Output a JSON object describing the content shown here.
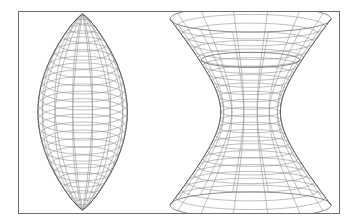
{
  "figure": {
    "background_color": "#ffffff",
    "border_color": "#6e6e6e",
    "line_color": "#8c8c8c",
    "outline_color": "#5f5f5f",
    "panel": {
      "x": 18,
      "y": 11,
      "width": 322,
      "height": 203
    },
    "shapes": [
      {
        "id": "lemon",
        "label": "lemon surface",
        "type": "spindle",
        "description": "Prolate lemon / football surface of revolution with cusp points at top and bottom",
        "center_x": 82,
        "top_y": 13,
        "bottom_y": 211,
        "max_half_width": 45,
        "meridians": 14,
        "parallels": 26,
        "cusped": true
      },
      {
        "id": "hyperboloid",
        "label": "hyperboloid of one sheet",
        "type": "spool",
        "description": "Hyperboloid of one sheet with open elliptical top rim, flared top and bottom",
        "center_x": 251,
        "top_y": 18,
        "bottom_y": 206,
        "waist_half_width": 30,
        "flare_half_width": 81,
        "rim_ellipse_ry": 13,
        "meridians": 14,
        "parallels": 24,
        "open_top": true
      }
    ]
  },
  "chart_data": {
    "type": "line",
    "xlabel": "",
    "ylabel": "",
    "series": [
      {
        "name": "lemon profile r(t)",
        "x": [
          0.0,
          0.1,
          0.2,
          0.3,
          0.4,
          0.5,
          0.6,
          0.7,
          0.8,
          0.9,
          1.0
        ],
        "values": [
          0.0,
          0.32,
          0.58,
          0.79,
          0.94,
          1.0,
          0.94,
          0.79,
          0.58,
          0.32,
          0.0
        ]
      },
      {
        "name": "hyperboloid profile r(t)",
        "x": [
          0.0,
          0.1,
          0.2,
          0.3,
          0.4,
          0.5,
          0.6,
          0.7,
          0.8,
          0.9,
          1.0
        ],
        "values": [
          1.0,
          0.8,
          0.62,
          0.48,
          0.39,
          0.37,
          0.39,
          0.48,
          0.62,
          0.8,
          1.0
        ]
      }
    ],
    "grid": true,
    "legend": "none"
  }
}
